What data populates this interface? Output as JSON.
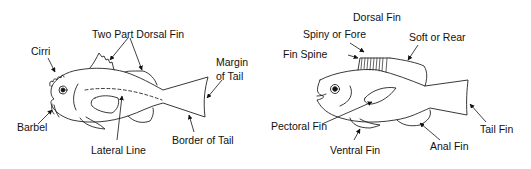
{
  "colors": {
    "line": "#222222",
    "text": "#111111",
    "background": "#ffffff"
  },
  "left_fish": {
    "labels": {
      "two_part_dorsal_fin": "Two Part Dorsal Fin",
      "cirri": "Cirri",
      "margin_of_tail_1": "Margin",
      "margin_of_tail_2": "of Tail",
      "barbel": "Barbel",
      "border_of_tail": "Border of Tail",
      "lateral_line": "Lateral Line"
    }
  },
  "right_fish": {
    "labels": {
      "dorsal_fin": "Dorsal Fin",
      "spiny_or_fore": "Spiny or Fore",
      "soft_or_rear": "Soft or Rear",
      "fin_spine": "Fin Spine",
      "pectoral_fin": "Pectoral Fin",
      "ventral_fin": "Ventral Fin",
      "anal_fin": "Anal Fin",
      "tail_fin": "Tail Fin"
    }
  }
}
